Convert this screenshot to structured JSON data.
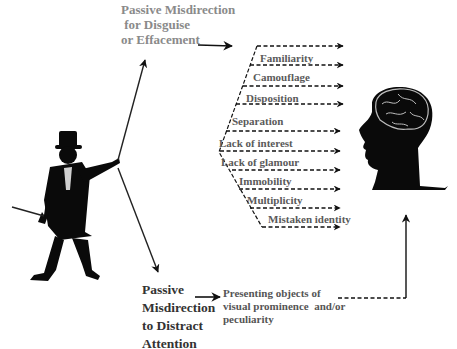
{
  "diagram": {
    "top_branch": {
      "title_lines": [
        "Passive Misdirection",
        " for Disguise",
        "or Effacement"
      ],
      "color": "#8a8a8a"
    },
    "techniques": [
      {
        "label": "Familiarity"
      },
      {
        "label": "Camouflage"
      },
      {
        "label": "Disposition"
      },
      {
        "label": "Separation"
      },
      {
        "label": "Lack of interest"
      },
      {
        "label": "Lack of glamour"
      },
      {
        "label": "Immobility"
      },
      {
        "label": "Multiplicity"
      },
      {
        "label": "Mistaken identity"
      }
    ],
    "bottom_branch": {
      "title_lines": [
        "Passive",
        "Misdirection",
        "to Distract",
        "Attention"
      ],
      "result_lines": [
        "Presenting objects of",
        "visual prominence  and/or",
        "peculiarity"
      ]
    },
    "figures": {
      "left": "magician-silhouette",
      "right": "head-with-brain-silhouette"
    }
  }
}
